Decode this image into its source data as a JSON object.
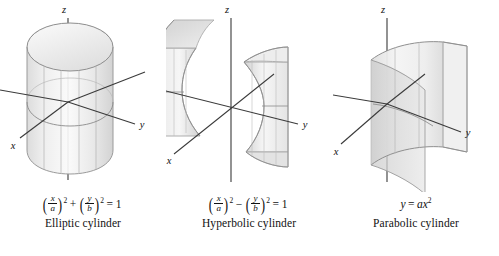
{
  "figure": {
    "background_color": "#ffffff",
    "surface_fill_light": "#f2f2f2",
    "surface_fill_mid": "#e2e2e2",
    "surface_fill_dark": "#cfcfcf",
    "outline_color": "#9a9a9a",
    "axis_color": "#3a3a3a",
    "text_color": "#111111"
  },
  "panels": [
    {
      "id": "elliptic",
      "name": "Elliptic cylinder",
      "caption": "Elliptic cylinder",
      "equation_plain": "(x/a)^2 + (y/b)^2 = 1",
      "equation_parts": {
        "left_open": "(",
        "num1": "x",
        "den1": "a",
        "left_close": ")",
        "exp1": "2",
        "operator": "+",
        "right_open": "(",
        "num2": "y",
        "den2": "b",
        "right_close": ")",
        "exp2": "2",
        "equals": "= 1"
      },
      "axes": {
        "x": "x",
        "y": "y",
        "z": "z"
      }
    },
    {
      "id": "hyperbolic",
      "name": "Hyperbolic cylinder",
      "caption": "Hyperbolic cylinder",
      "equation_plain": "(x/a)^2 - (y/b)^2 = 1",
      "equation_parts": {
        "left_open": "(",
        "num1": "x",
        "den1": "a",
        "left_close": ")",
        "exp1": "2",
        "operator": "−",
        "right_open": "(",
        "num2": "y",
        "den2": "b",
        "right_close": ")",
        "exp2": "2",
        "equals": "= 1"
      },
      "axes": {
        "x": "x",
        "y": "y",
        "z": "z"
      }
    },
    {
      "id": "parabolic",
      "name": "Parabolic cylinder",
      "caption": "Parabolic cylinder",
      "equation_plain": "y = ax^2",
      "equation_parts": {
        "lhs": "y",
        "equals": "=",
        "coefficient": "a",
        "variable": "x",
        "exponent": "2"
      },
      "axes": {
        "x": "x",
        "y": "y",
        "z": "z"
      }
    }
  ]
}
